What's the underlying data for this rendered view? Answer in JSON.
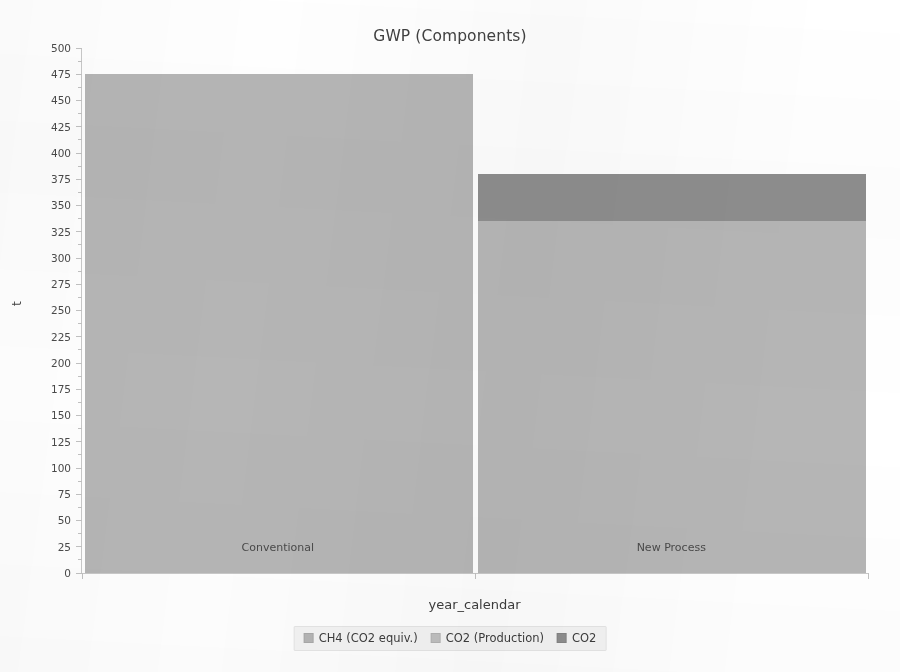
{
  "chart_data": {
    "type": "bar",
    "subtype": "stacked",
    "title": "GWP (Components)",
    "xlabel": "year_calendar",
    "ylabel": "t",
    "categories": [
      "Conventional",
      "New Process"
    ],
    "series": [
      {
        "name": "CH4 (CO2 equiv.)",
        "color": "#b6b6b6",
        "values": [
          475,
          335
        ]
      },
      {
        "name": "CO2 (Production)",
        "color": "#c0c0c0",
        "values": [
          0,
          0
        ]
      },
      {
        "name": "CO2",
        "color": "#8e8e8e",
        "values": [
          0,
          45
        ]
      }
    ],
    "totals": [
      475,
      380
    ],
    "ylim": [
      0,
      500
    ],
    "yticks": [
      0,
      25,
      50,
      75,
      100,
      125,
      150,
      175,
      200,
      225,
      250,
      275,
      300,
      325,
      350,
      375,
      400,
      425,
      450,
      475,
      500
    ],
    "ytick_labels": [
      "0",
      "25",
      "50",
      "75",
      "100",
      "125",
      "150",
      "175",
      "200",
      "225",
      "250",
      "275",
      "300",
      "325",
      "350",
      "375",
      "400",
      "425",
      "450",
      "475",
      "500"
    ],
    "ytick_step": 25,
    "grid": false,
    "legend_position": "bottom",
    "legend": [
      "CH4 (CO2 equiv.)",
      "CO2 (Production)",
      "CO2"
    ]
  },
  "colors": {
    "bar_light": "#b6b6b6",
    "bar_mid": "#c0c0c0",
    "bar_dark": "#8e8e8e",
    "axis": "#c2c2c2",
    "text": "#414141",
    "legend_bg": "#f4f4f4"
  }
}
